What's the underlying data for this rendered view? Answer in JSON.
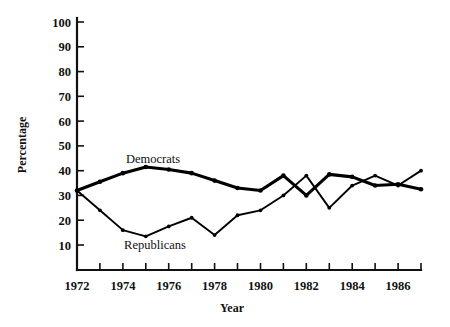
{
  "chart_data": {
    "type": "line",
    "title": "",
    "xlabel": "Year",
    "ylabel": "Percentage",
    "xlim": [
      1972,
      1987
    ],
    "ylim": [
      0,
      105
    ],
    "ytick_values": [
      10,
      20,
      30,
      40,
      50,
      60,
      70,
      80,
      90,
      100
    ],
    "ytick_labels": [
      "10",
      "20",
      "30",
      "40",
      "50",
      "60",
      "70",
      "80",
      "90",
      "100"
    ],
    "x": [
      1972,
      1973,
      1974,
      1975,
      1976,
      1977,
      1978,
      1979,
      1980,
      1981,
      1982,
      1983,
      1984,
      1985,
      1986,
      1987
    ],
    "xtick_values": [
      1972,
      1973,
      1974,
      1975,
      1976,
      1977,
      1978,
      1979,
      1980,
      1981,
      1982,
      1983,
      1984,
      1985,
      1986,
      1987
    ],
    "xtick_labels": [
      "1972",
      "",
      "1974",
      "",
      "1976",
      "",
      "1978",
      "",
      "1980",
      "",
      "1982",
      "",
      "1984",
      "",
      "1986",
      ""
    ],
    "xtick_labels_shown": [
      "1972",
      "1974",
      "1976",
      "1978",
      "1980",
      "1982",
      "1984",
      "1986"
    ],
    "grid": false,
    "legend_position": "inline-annotations",
    "series": [
      {
        "name": "Democrats",
        "label_text": "Democrats",
        "line_weight": "thick",
        "color": "#000000",
        "values": [
          32,
          35.5,
          39,
          41.5,
          40.5,
          39,
          36,
          33,
          32,
          38,
          30,
          38.5,
          37.5,
          34,
          34.5,
          32.5
        ]
      },
      {
        "name": "Republicans",
        "label_text": "Republicans",
        "line_weight": "thin",
        "color": "#000000",
        "values": [
          32,
          24,
          16,
          13.5,
          17.5,
          21,
          14,
          22,
          24,
          30,
          38,
          25,
          34,
          38,
          34,
          40
        ]
      }
    ]
  },
  "annotations": {
    "democrats_label": "Democrats",
    "republicans_label": "Republicans"
  },
  "axes": {
    "y_title": "Percentage",
    "x_title": "Year"
  }
}
